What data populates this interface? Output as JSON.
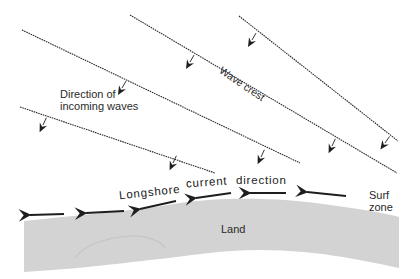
{
  "labels": {
    "direction_of_incoming_line1": "Direction of",
    "direction_of_incoming_line2": "incoming waves",
    "wave_crest": "Wave crest",
    "longshore": "Longshore",
    "current": "current",
    "direction": "direction",
    "surf_line1": "Surf",
    "surf_line2": "zone",
    "land": "Land"
  },
  "colors": {
    "background": "#ffffff",
    "land": "#d3d3d3",
    "line": "#2b2b2b",
    "text": "#2a2a2a"
  },
  "wave_crests": [
    {
      "from": [
        239,
        16
      ],
      "to": [
        398,
        141
      ]
    },
    {
      "from": [
        130,
        15
      ],
      "to": [
        397,
        173
      ]
    },
    {
      "from": [
        22,
        30
      ],
      "to": [
        300,
        163
      ]
    },
    {
      "from": [
        20,
        107
      ],
      "to": [
        215,
        173
      ]
    }
  ],
  "wave_direction_arrow_count": 8,
  "longshore_arrow_count": 7
}
